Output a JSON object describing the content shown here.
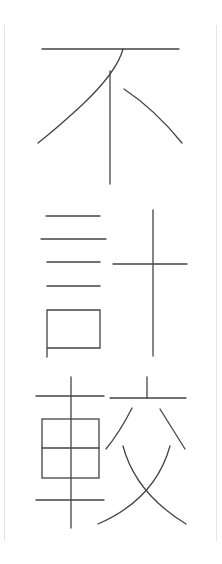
{
  "artwork": {
    "text": "不計較",
    "characters": [
      {
        "char": "不"
      },
      {
        "char": "計"
      },
      {
        "char": "較"
      }
    ],
    "orientation": "vertical",
    "stroke_color": "#444444",
    "border_color": "#e4e4e4",
    "background_color": "#ffffff"
  }
}
